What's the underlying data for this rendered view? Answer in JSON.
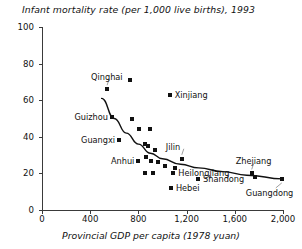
{
  "chart_data": {
    "type": "scatter",
    "title": "Infant mortality rate (per 1,000 live births), 1993",
    "xlabel": "Provincial GDP per capita (1978 yuan)",
    "ylabel": "",
    "xlim": [
      0,
      2000
    ],
    "ylim": [
      0,
      100
    ],
    "grid": false,
    "legend": "none",
    "xticks": [
      "0",
      "400",
      "800",
      "1,200",
      "1,600",
      "2,000"
    ],
    "xtick_values": [
      0,
      400,
      800,
      1200,
      1600,
      2000
    ],
    "yticks": [
      "0",
      "20",
      "40",
      "60",
      "80",
      "100"
    ],
    "ytick_values": [
      0,
      20,
      40,
      60,
      80,
      100
    ],
    "points": [
      {
        "x": 540,
        "y": 66,
        "label": "Qinghai",
        "label_pos": "above"
      },
      {
        "x": 730,
        "y": 71,
        "label": "",
        "label_pos": ""
      },
      {
        "x": 580,
        "y": 51,
        "label": "Guizhou",
        "label_pos": "left"
      },
      {
        "x": 745,
        "y": 50,
        "label": "",
        "label_pos": ""
      },
      {
        "x": 805,
        "y": 44,
        "label": "",
        "label_pos": ""
      },
      {
        "x": 640,
        "y": 38,
        "label": "Guangxi",
        "label_pos": "left"
      },
      {
        "x": 1060,
        "y": 63,
        "label": "Xinjiang",
        "label_pos": "right"
      },
      {
        "x": 855,
        "y": 36,
        "label": "",
        "label_pos": ""
      },
      {
        "x": 880,
        "y": 35,
        "label": "",
        "label_pos": ""
      },
      {
        "x": 900,
        "y": 44,
        "label": "",
        "label_pos": ""
      },
      {
        "x": 940,
        "y": 33,
        "label": "",
        "label_pos": ""
      },
      {
        "x": 800,
        "y": 27,
        "label": "Anhui",
        "label_pos": "left"
      },
      {
        "x": 860,
        "y": 29,
        "label": "",
        "label_pos": ""
      },
      {
        "x": 905,
        "y": 27,
        "label": "",
        "label_pos": ""
      },
      {
        "x": 965,
        "y": 26,
        "label": "",
        "label_pos": ""
      },
      {
        "x": 1020,
        "y": 24,
        "label": "",
        "label_pos": ""
      },
      {
        "x": 1160,
        "y": 28,
        "label": "Jilin",
        "label_pos": "above"
      },
      {
        "x": 1105,
        "y": 23,
        "label": "",
        "label_pos": ""
      },
      {
        "x": 855,
        "y": 20,
        "label": "",
        "label_pos": ""
      },
      {
        "x": 920,
        "y": 20,
        "label": "",
        "label_pos": ""
      },
      {
        "x": 1090,
        "y": 20,
        "label": "Heilongjiang",
        "label_pos": "right"
      },
      {
        "x": 1070,
        "y": 12,
        "label": "Hebei",
        "label_pos": "right"
      },
      {
        "x": 1295,
        "y": 17,
        "label": "Shandong",
        "label_pos": "right"
      },
      {
        "x": 1740,
        "y": 20,
        "label": "Zhejiang",
        "label_pos": "above"
      },
      {
        "x": 1770,
        "y": 18,
        "label": "",
        "label_pos": ""
      },
      {
        "x": 1990,
        "y": 17,
        "label": "Guangdong",
        "label_pos": "below"
      }
    ],
    "fit_curve": {
      "description": "downward-sloping fitted trend curve",
      "points": [
        {
          "x": 495,
          "y": 61
        },
        {
          "x": 600,
          "y": 50
        },
        {
          "x": 700,
          "y": 42
        },
        {
          "x": 800,
          "y": 36
        },
        {
          "x": 900,
          "y": 31
        },
        {
          "x": 1000,
          "y": 28
        },
        {
          "x": 1150,
          "y": 25
        },
        {
          "x": 1300,
          "y": 23
        },
        {
          "x": 1500,
          "y": 21
        },
        {
          "x": 1700,
          "y": 19
        },
        {
          "x": 2000,
          "y": 17
        }
      ]
    },
    "labels": [
      "Qinghai",
      "Guizhou",
      "Guangxi",
      "Xinjiang",
      "Anhui",
      "Jilin",
      "Heilongjiang",
      "Hebei",
      "Shandong",
      "Zhejiang",
      "Guangdong"
    ]
  }
}
